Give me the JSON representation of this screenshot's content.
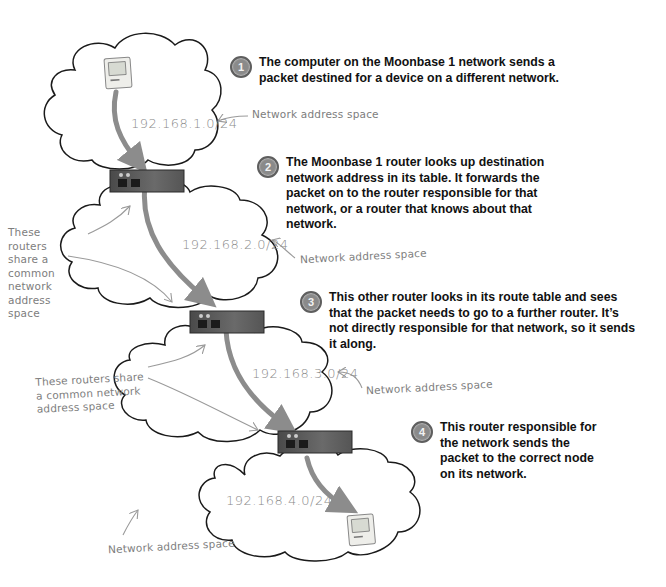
{
  "steps": [
    {
      "number": "1",
      "text": "The computer on the Moonbase 1 network sends a packet destined for a device on a different network."
    },
    {
      "number": "2",
      "text": "The Moonbase 1 router looks up destination network address in its table. It forwards the packet on to the router responsible for that network, or a router that knows about that network."
    },
    {
      "number": "3",
      "text": "This other router looks in its route table and sees that the packet needs to go to a further router. It’s not directly responsible for that network, so it sends it along."
    },
    {
      "number": "4",
      "text": "This router responsible for the network sends the packet to the correct node on its network."
    }
  ],
  "networks": [
    {
      "address": "192.168.1.0/24",
      "label": "Network address space"
    },
    {
      "address": "192.168.2.0/24",
      "label": "Network address space"
    },
    {
      "address": "192.168.3.0/24",
      "label": "Network address space"
    },
    {
      "address": "192.168.4.0/24",
      "label": "Network address space"
    }
  ],
  "annotations": {
    "shared_space_1": "These routers share a common network address space",
    "shared_space_2": "These routers share a common network address space"
  },
  "devices": {
    "source_computer": "computer-icon",
    "destination_computer": "computer-icon",
    "routers": [
      "router-icon",
      "router-icon",
      "router-icon"
    ]
  },
  "colors": {
    "arrow": "#8c8c8c",
    "cloud_stroke": "#1a1a1a",
    "router_body": "#5a5a5a",
    "badge": "#8a8a8a",
    "handwriting": "#7d7d7d"
  }
}
